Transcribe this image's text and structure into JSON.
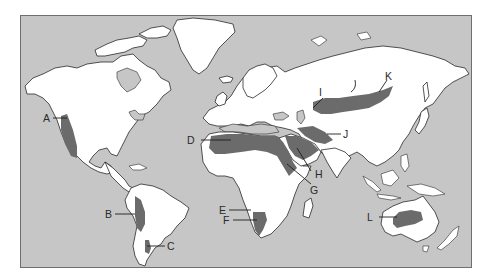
{
  "map": {
    "title": "",
    "type": "world map of desert regions",
    "colors": {
      "ocean": "#c6c6c6",
      "land": "#ffffff",
      "desert": "#6b6b6b",
      "frame": "#6f6f6f"
    },
    "labels": [
      {
        "id": "A",
        "text": "A",
        "region": "western North America"
      },
      {
        "id": "B",
        "text": "B",
        "region": "western South America"
      },
      {
        "id": "C",
        "text": "C",
        "region": "southern South America"
      },
      {
        "id": "D",
        "text": "D",
        "region": "northern Africa"
      },
      {
        "id": "E",
        "text": "E",
        "region": "southwestern Africa (north)"
      },
      {
        "id": "F",
        "text": "F",
        "region": "southwestern Africa (south)"
      },
      {
        "id": "G",
        "text": "G",
        "region": "Horn of Africa"
      },
      {
        "id": "H",
        "text": "H",
        "region": "Arabian Peninsula"
      },
      {
        "id": "I",
        "text": "I",
        "region": "Central Asia"
      },
      {
        "id": "J",
        "text": "J",
        "region": "Iran / South Asia"
      },
      {
        "id": "K",
        "text": "K",
        "region": "East Asia (Gobi)"
      },
      {
        "id": "L",
        "text": "L",
        "region": "Australia"
      }
    ]
  }
}
